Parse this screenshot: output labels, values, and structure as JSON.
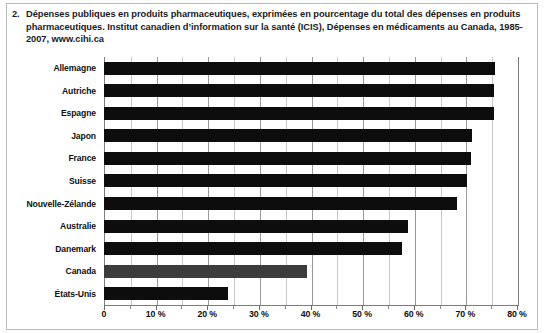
{
  "caption": {
    "number": "2.",
    "text": "Dépenses publiques en produits pharmaceutiques, exprimées en pourcentage du total des dépenses en produits pharmaceutiques. Institut canadien d’information sur la santé (ICIS), Dépenses en médicaments au Canada, 1985-2007, www.cihi.ca"
  },
  "colors": {
    "bar": "#0d0d0d",
    "bar_highlight": "#3c3c3c",
    "gridline": "#c9c9c9",
    "axis": "#7d7d7d",
    "background": "#ffffff",
    "text": "#101010"
  },
  "chart_data": {
    "type": "bar",
    "orientation": "horizontal",
    "title": "Dépenses publiques en produits pharmaceutiques, exprimées en pourcentage du total des dépenses en produits pharmaceutiques",
    "source": "Institut canadien d’information sur la santé (ICIS), Dépenses en médicaments au Canada, 1985-2007, www.cihi.ca",
    "xlabel": "",
    "ylabel": "",
    "xlim": [
      0,
      80
    ],
    "grid": true,
    "legend": "none",
    "xtick_labels": [
      "0",
      "10 %",
      "20 %",
      "30 %",
      "40 %",
      "50 %",
      "60 %",
      "70 %",
      "80 %"
    ],
    "xtick_values": [
      0,
      10,
      20,
      30,
      40,
      50,
      60,
      70,
      80
    ],
    "minor_tick_step": 5,
    "highlight_category": "Canada",
    "categories": [
      "Allemagne",
      "Autriche",
      "Espagne",
      "Japon",
      "France",
      "Suisse",
      "Nouvelle-Zélande",
      "Australie",
      "Danemark",
      "Canada",
      "États-Unis"
    ],
    "values": [
      75.8,
      75.6,
      75.5,
      71.3,
      71.1,
      70.3,
      68.4,
      58.9,
      57.8,
      39.3,
      24.0
    ]
  }
}
